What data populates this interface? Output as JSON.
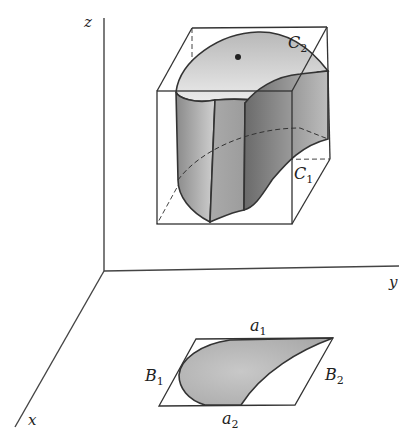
{
  "figure": {
    "axes": {
      "x_label": "x",
      "y_label": "y",
      "z_label": "z"
    },
    "curves": {
      "upper_curve": {
        "letter": "C",
        "sub": "2"
      },
      "lower_curve": {
        "letter": "C",
        "sub": "1"
      }
    },
    "base_region": {
      "top_edge": {
        "letter": "a",
        "sub": "1"
      },
      "bottom_edge": {
        "letter": "a",
        "sub": "2"
      },
      "left_edge": {
        "letter": "B",
        "sub": "1"
      },
      "right_edge": {
        "letter": "B",
        "sub": "2"
      }
    },
    "colors": {
      "line": "#333333",
      "shade_light": "#d8d8d8",
      "shade_mid": "#b0b0b0",
      "shade_dark": "#7a7a7a",
      "background": "#ffffff"
    }
  }
}
